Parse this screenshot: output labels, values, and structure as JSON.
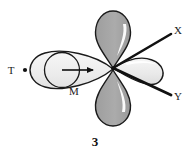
{
  "figure": {
    "caption": "3",
    "labels": {
      "T": "T",
      "M": "M",
      "X": "X",
      "Y": "Y"
    },
    "colors": {
      "background": "#ffffff",
      "outline": "#1a1a1a",
      "dark_lobe_fill": "#a8a8a8",
      "light_lobe_fill": "#ededed",
      "pale_lobe_fill": "#f2f2f2",
      "highlight": "#ffffff",
      "bond_line": "#111111",
      "text": "#1a1a1a"
    },
    "elements": {
      "center_atom_label": "M",
      "terminal_atom_label": "T",
      "terminal_dot": "•",
      "ligand_axis_upper_label": "X",
      "ligand_axis_lower_label": "Y",
      "arrow_direction": "right",
      "lobes": [
        {
          "name": "top-lobe",
          "orientation": "up",
          "shade": "dark"
        },
        {
          "name": "bottom-lobe",
          "orientation": "down",
          "shade": "dark"
        },
        {
          "name": "right-lobe",
          "orientation": "right",
          "shade": "light"
        },
        {
          "name": "left-lens-lobe",
          "orientation": "left",
          "shade": "pale"
        }
      ]
    }
  }
}
